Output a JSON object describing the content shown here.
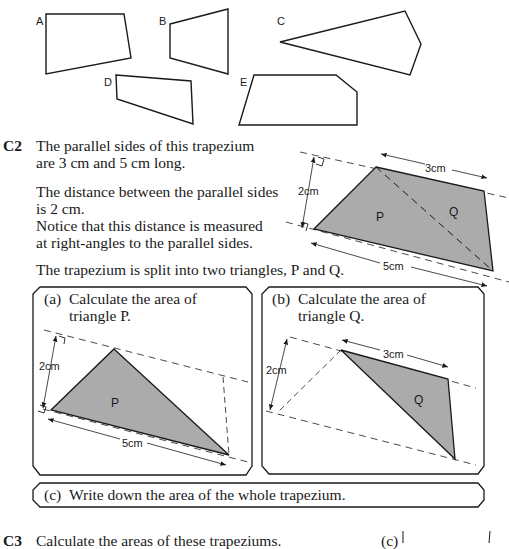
{
  "shapes": {
    "labels": [
      "A",
      "B",
      "C",
      "D",
      "E"
    ]
  },
  "c2": {
    "number": "C2",
    "lines": [
      "The parallel sides of this trapezium",
      "are 3 cm and 5 cm long.",
      "The distance between the parallel sides",
      "is 2 cm.",
      "Notice that this distance is measured",
      "at right-angles to the parallel sides.",
      "The trapezium is split into two triangles, P and Q."
    ],
    "diagram": {
      "height_label": "2cm",
      "top_label": "3cm",
      "bottom_label": "5cm",
      "triangle_p": "P",
      "triangle_q": "Q"
    },
    "part_a": {
      "label": "(a)",
      "line1": "Calculate the area of",
      "line2": "triangle P.",
      "height_label": "2cm",
      "base_label": "5cm",
      "triangle": "P"
    },
    "part_b": {
      "label": "(b)",
      "line1": "Calculate the area of",
      "line2": "triangle Q.",
      "height_label": "2cm",
      "base_label": "3cm",
      "triangle": "Q"
    },
    "part_c": {
      "label": "(c)",
      "text": "Write down the area of the whole trapezium."
    }
  },
  "c3": {
    "number": "C3",
    "text": "Calculate the areas of these trapeziums.",
    "side_label": "(c)"
  },
  "colors": {
    "fill": "#ababab",
    "stroke": "#1a1a1a"
  }
}
